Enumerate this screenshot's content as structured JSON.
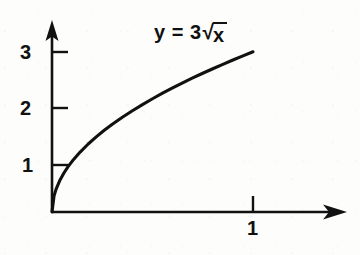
{
  "figure": {
    "background_color": "#fdfdfc",
    "ink_color": "#111111",
    "equation": {
      "lhs": "y = 3",
      "radical_sign": "√",
      "radicand": "x"
    }
  },
  "chart_data": {
    "type": "line",
    "title": "",
    "subtitle": "",
    "xlabel": "",
    "ylabel": "",
    "function": "y = 3√x",
    "legend": [],
    "annotations": [
      {
        "text": "y = 3√x",
        "x": 0.73,
        "y": 3.1
      }
    ],
    "grid": false,
    "xlim": [
      0,
      1.46
    ],
    "ylim": [
      0,
      3.36
    ],
    "xticks": [
      1
    ],
    "xtick_labels": [
      "1"
    ],
    "yticks": [
      1,
      2,
      3
    ],
    "ytick_labels": [
      "1",
      "2",
      "3"
    ],
    "axis_arrows": true,
    "series": [
      {
        "name": "y = 3√x",
        "color": "#111111",
        "x": [
          0,
          0.01,
          0.02,
          0.04,
          0.06,
          0.08,
          0.1,
          0.14,
          0.18,
          0.22,
          0.26,
          0.3,
          0.35,
          0.4,
          0.45,
          0.5,
          0.55,
          0.6,
          0.65,
          0.7,
          0.75,
          0.8,
          0.85,
          0.9,
          0.95,
          1.0
        ],
        "y": [
          0,
          0.3,
          0.424,
          0.6,
          0.735,
          0.849,
          0.949,
          1.122,
          1.273,
          1.407,
          1.53,
          1.643,
          1.775,
          1.897,
          2.012,
          2.121,
          2.225,
          2.324,
          2.419,
          2.51,
          2.598,
          2.683,
          2.766,
          2.846,
          2.925,
          3.0
        ]
      }
    ]
  },
  "geometry": {
    "origin_x": 52,
    "origin_y": 212,
    "x_axis_tip": 345,
    "y_axis_tip": 22,
    "px_per_x_unit": 201,
    "px_per_y_unit": 53.4
  },
  "labels": {
    "y_3": "3",
    "y_2": "2",
    "y_1": "1",
    "x_1": "1"
  }
}
